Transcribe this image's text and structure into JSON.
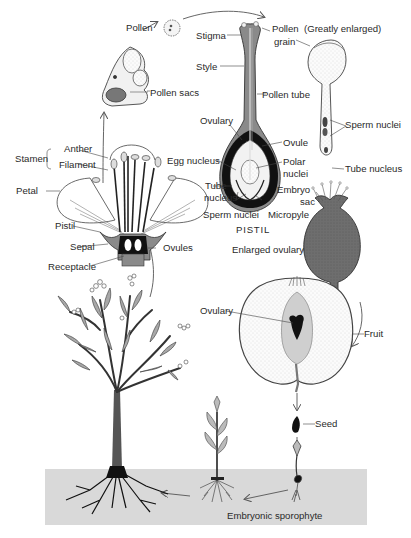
{
  "diagram": {
    "colors": {
      "ink": "#2a2a2a",
      "ground": "#d9d9d9",
      "mid_gray": "#8a8a8a",
      "dark_gray": "#555555",
      "light_gray": "#c8c8c8"
    },
    "labels": {
      "pollen": "Pollen",
      "pollen_sacs": "Pollen sacs",
      "stigma": "Stigma",
      "pollen_grain_1": "Pollen",
      "pollen_grain_2": "grain",
      "greatly_enlarged": "(Greatly enlarged)",
      "style": "Style",
      "pollen_tube": "Pollen tube",
      "sperm_nuclei_right": "Sperm nuclei",
      "ovulary_top": "Ovulary",
      "ovule": "Ovule",
      "egg_nucleus": "Egg nucleus",
      "polar_nuclei_1": "Polar",
      "polar_nuclei_2": "nuclei",
      "tube_nucleus_right": "Tube nucleus",
      "tube_nucleus_left_1": "Tube",
      "tube_nucleus_left_2": "nucleus",
      "embryo_sac_1": "Embryo",
      "embryo_sac_2": "sac",
      "sperm_nuclei_left": "Sperm nuclei",
      "micropyle": "Micropyle",
      "pistil_caption": "PISTIL",
      "stamen": "Stamen",
      "anther": "Anther",
      "filament": "Filament",
      "petal": "Petal",
      "pistil": "Pistil",
      "sepal": "Sepal",
      "ovules": "Ovules",
      "receptacle": "Receptacle",
      "enlarged_ovulary": "Enlarged ovulary",
      "ovulary_fruit": "Ovulary",
      "fruit": "Fruit",
      "seed": "Seed",
      "embryonic_sporophyte": "Embryonic sporophyte"
    },
    "stages": [
      "Mature tree (sporophyte)",
      "Flower",
      "Stamen / anther with pollen sacs",
      "Pollen",
      "Pistil with pollen tube",
      "Enlarged ovulary",
      "Fruit",
      "Seed",
      "Germinating seedling",
      "Young plant"
    ]
  }
}
